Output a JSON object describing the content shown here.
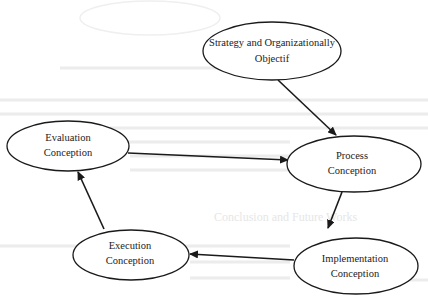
{
  "diagram": {
    "type": "flow-cycle",
    "nodes": [
      {
        "id": "strategy",
        "lines": [
          "Strategy and Organizationally",
          "Objectif"
        ],
        "cx": 272,
        "cy": 51,
        "rx": 69,
        "ry": 29
      },
      {
        "id": "process",
        "lines": [
          "Process",
          "Conception"
        ],
        "cx": 354,
        "cy": 164,
        "rx": 67,
        "ry": 28
      },
      {
        "id": "implementation",
        "lines": [
          "Implementation",
          "Conception"
        ],
        "cx": 356,
        "cy": 266,
        "rx": 62,
        "ry": 28
      },
      {
        "id": "execution",
        "lines": [
          "Execution",
          "Conception"
        ],
        "cx": 131,
        "cy": 255,
        "rx": 58,
        "ry": 25
      },
      {
        "id": "evaluation",
        "lines": [
          "Evaluation",
          "Conception"
        ],
        "cx": 68,
        "cy": 146,
        "rx": 61,
        "ry": 25
      }
    ],
    "edges": [
      {
        "from": "strategy",
        "to": "process"
      },
      {
        "from": "evaluation",
        "to": "process"
      },
      {
        "from": "process",
        "to": "implementation"
      },
      {
        "from": "implementation",
        "to": "execution"
      },
      {
        "from": "execution",
        "to": "evaluation"
      }
    ],
    "background_bleed": {
      "heading": "Conclusion and Future Works"
    }
  }
}
